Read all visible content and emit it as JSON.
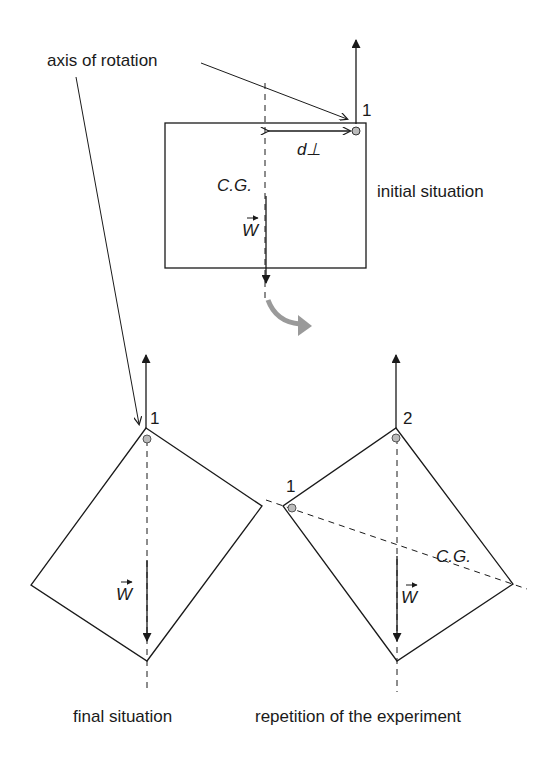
{
  "diagram": {
    "labels": {
      "axis_of_rotation": "axis of rotation",
      "initial_situation": "initial situation",
      "final_situation": "final situation",
      "repetition": "repetition of the experiment",
      "cg_initial": "C.G.",
      "cg_repetition": "C.G.",
      "d_perp": "d⊥",
      "weight": "W",
      "point_1_initial": "1",
      "point_1_final": "1",
      "point_1_repetition": "1",
      "point_2_repetition": "2"
    },
    "colors": {
      "line": "#1a1a1a",
      "curved_arrow": "#999999",
      "pivot": "#aaaaaa"
    }
  }
}
